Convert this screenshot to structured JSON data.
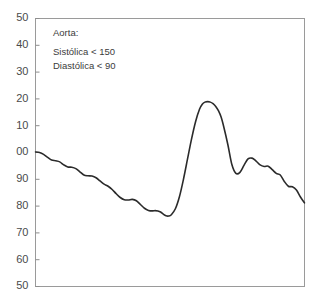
{
  "figure": {
    "width": 319,
    "height": 299,
    "background_color": "#ffffff"
  },
  "annotation": {
    "title_line": "Aorta:",
    "systolic_line": "Sistólica < 150",
    "diastolic_line": "Diastólica < 90"
  },
  "style": {
    "frame_color": "#9a9a9a",
    "tick_color": "#8d8d8d",
    "tick_label_color": "#4a4a4a",
    "annotation_color": "#3b3b3b",
    "curve_color": "#2b2b2b"
  },
  "chart_data": {
    "type": "line",
    "title": "",
    "subtitle": "",
    "xlabel": "",
    "ylabel": "",
    "grid": false,
    "legend_position": "none",
    "annotations": [
      "Aorta:",
      "Sistólica < 150",
      "Diastólica < 90"
    ],
    "y_tick_labels": [
      "50",
      "40",
      "30",
      "20",
      "10",
      "00",
      "90",
      "80",
      "70",
      "60",
      "50"
    ],
    "y_tick_values": [
      150,
      140,
      130,
      120,
      110,
      100,
      90,
      80,
      70,
      60,
      50
    ],
    "ylim": [
      50,
      150
    ],
    "xlim": [
      0,
      100
    ],
    "x_tick_labels": [],
    "series": [
      {
        "name": "Pressão aórtica",
        "x": [
          0.0,
          1.5,
          3.0,
          4.5,
          6.0,
          7.5,
          9.0,
          10.5,
          12.0,
          13.5,
          15.0,
          16.5,
          18.0,
          19.5,
          21.0,
          22.5,
          24.0,
          25.5,
          27.0,
          28.5,
          30.0,
          31.5,
          33.0,
          34.5,
          36.0,
          37.5,
          39.0,
          40.5,
          42.0,
          43.5,
          44.5,
          45.5,
          46.5,
          47.5,
          48.5,
          49.5,
          50.5,
          52.0,
          53.5,
          55.0,
          56.5,
          58.0,
          59.5,
          61.0,
          62.0,
          63.0,
          64.0,
          65.0,
          66.0,
          67.0,
          68.0,
          69.0,
          70.0,
          71.5,
          73.0,
          74.5,
          76.0,
          77.5,
          79.0,
          80.5,
          82.0,
          83.5,
          85.0,
          86.5,
          88.0,
          89.5,
          91.0,
          92.5,
          94.0,
          95.5,
          97.0,
          98.5,
          100.0
        ],
        "y": [
          100.2,
          100.0,
          99.3,
          98.2,
          97.2,
          96.9,
          96.5,
          95.4,
          94.6,
          94.5,
          94.0,
          92.8,
          91.6,
          91.3,
          91.2,
          90.6,
          89.4,
          88.2,
          87.4,
          86.2,
          84.6,
          83.2,
          82.4,
          82.3,
          82.5,
          82.0,
          80.6,
          79.2,
          78.4,
          78.2,
          78.3,
          78.2,
          77.8,
          77.0,
          76.4,
          76.3,
          76.8,
          79.0,
          83.5,
          90.0,
          97.5,
          105.0,
          111.5,
          116.2,
          118.0,
          118.8,
          119.0,
          118.8,
          118.2,
          117.2,
          115.6,
          113.2,
          109.5,
          103.0,
          95.5,
          92.2,
          92.6,
          95.2,
          97.6,
          97.9,
          96.8,
          95.4,
          94.8,
          94.9,
          93.6,
          92.2,
          91.6,
          89.2,
          87.4,
          87.2,
          86.0,
          83.4,
          81.2
        ]
      }
    ],
    "features": {
      "systolic_peak": 119,
      "diastolic_trough": 76,
      "dicrotic_notch": 92,
      "dicrotic_rebound": 98,
      "start_value": 100,
      "end_value": 81
    }
  }
}
